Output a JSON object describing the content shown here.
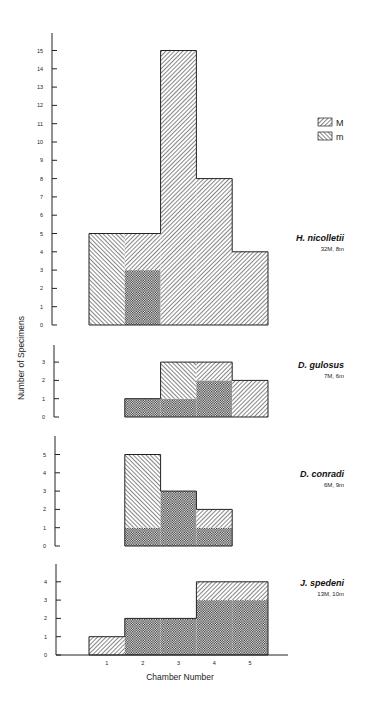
{
  "chart_data": [
    {
      "type": "bar",
      "title": "H. nicolletii",
      "subtitle": "32M, 8m",
      "xlabel": "Chamber Number",
      "ylabel": "Number of Specimens",
      "categories": [
        "1",
        "2",
        "3",
        "4",
        "5"
      ],
      "series": [
        {
          "name": "M",
          "values": [
            0,
            5,
            15,
            8,
            4
          ]
        },
        {
          "name": "m",
          "values": [
            5,
            3,
            0,
            0,
            0
          ]
        }
      ],
      "ylim": [
        0,
        15
      ],
      "yticks": [
        0,
        1,
        2,
        3,
        4,
        5,
        6,
        7,
        8,
        9,
        10,
        11,
        12,
        13,
        14,
        15
      ],
      "grid": false
    },
    {
      "type": "bar",
      "title": "D. gulosus",
      "subtitle": "7M, 6m",
      "categories": [
        "1",
        "2",
        "3",
        "4",
        "5"
      ],
      "series": [
        {
          "name": "M",
          "values": [
            0,
            1,
            1,
            3,
            2
          ]
        },
        {
          "name": "m",
          "values": [
            0,
            1,
            3,
            2,
            0
          ]
        }
      ],
      "ylim": [
        0,
        3
      ],
      "yticks": [
        0,
        1,
        2,
        3
      ],
      "grid": false
    },
    {
      "type": "bar",
      "title": "D. conradi",
      "subtitle": "6M, 9m",
      "categories": [
        "1",
        "2",
        "3",
        "4",
        "5"
      ],
      "series": [
        {
          "name": "M",
          "values": [
            0,
            1,
            3,
            2,
            0
          ]
        },
        {
          "name": "m",
          "values": [
            0,
            5,
            3,
            1,
            0
          ]
        }
      ],
      "ylim": [
        0,
        5
      ],
      "yticks": [
        0,
        1,
        2,
        3,
        4,
        5
      ],
      "grid": false
    },
    {
      "type": "bar",
      "title": "J. spedeni",
      "subtitle": "13M, 10m",
      "categories": [
        "1",
        "2",
        "3",
        "4",
        "5"
      ],
      "series": [
        {
          "name": "M",
          "values": [
            1,
            2,
            2,
            4,
            4
          ]
        },
        {
          "name": "m",
          "values": [
            0,
            2,
            2,
            3,
            3
          ]
        }
      ],
      "ylim": [
        0,
        4
      ],
      "yticks": [
        0,
        1,
        2,
        3,
        4
      ],
      "grid": false
    }
  ],
  "legend": {
    "position": "upper right",
    "items": [
      {
        "label": "M",
        "pattern": "hatch-backslash"
      },
      {
        "label": "m",
        "pattern": "hatch-slash"
      }
    ],
    "overlap_pattern": "crosshatch"
  },
  "axes": {
    "ylabel": "Number of Specimens",
    "xlabel": "Chamber Number",
    "xticks": [
      "1",
      "2",
      "3",
      "4",
      "5"
    ]
  },
  "colors": {
    "ink": "#222222",
    "background": "#ffffff"
  }
}
